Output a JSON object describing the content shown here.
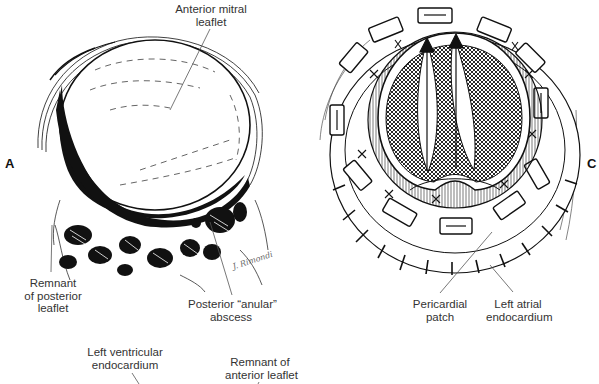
{
  "figure": {
    "panels": [
      {
        "letter": "A",
        "labels": {
          "anterior_mitral_leaflet": [
            "Anterior mitral",
            "leaflet"
          ],
          "remnant_posterior_leaflet": [
            "Remnant",
            "of posterior",
            "leaflet"
          ],
          "posterior_anular_abscess": [
            "Posterior “anular”",
            "abscess"
          ]
        },
        "signature": "J. Rimondi"
      },
      {
        "letter": "C",
        "labels": {
          "pericardial_patch": [
            "Pericardial",
            "patch"
          ],
          "left_atrial_endocardium": [
            "Left atrial",
            "endocardium"
          ]
        }
      }
    ],
    "lower_labels": {
      "left_ventricular_endocardium": [
        "Left ventricular",
        "endocardium"
      ],
      "remnant_anterior_leaflet": [
        "Remnant of",
        "anterior leaflet"
      ]
    },
    "colors": {
      "ink": "#111111",
      "label": "#333333",
      "leader": "#555555",
      "background": "#ffffff"
    }
  }
}
